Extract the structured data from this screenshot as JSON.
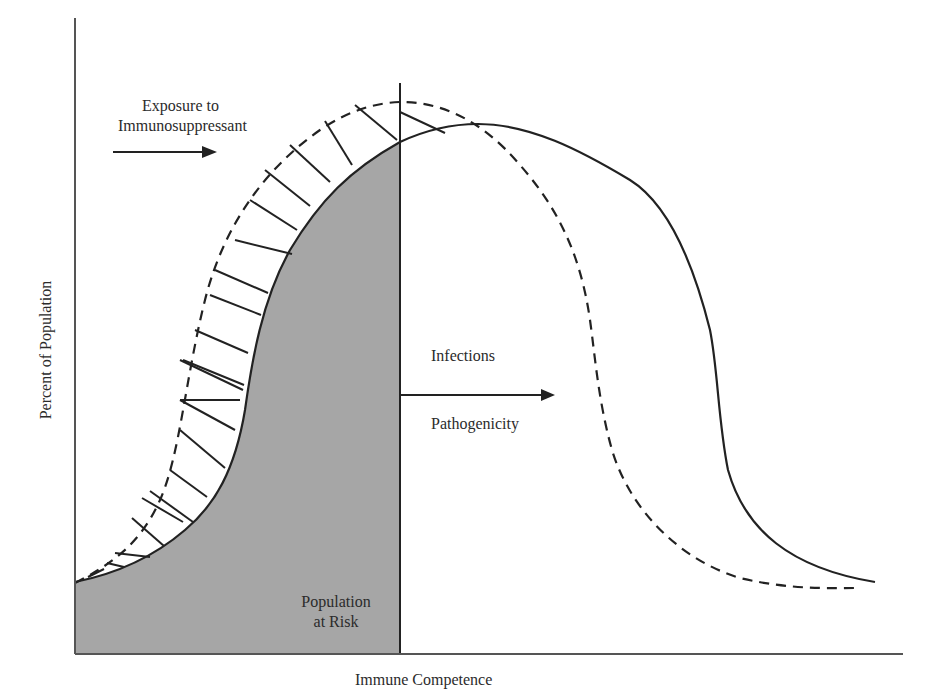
{
  "figure": {
    "x_axis_label": "Immune Competence",
    "y_axis_label": "Percent of Population",
    "annotations": {
      "exposure_line1": "Exposure to",
      "exposure_line2": "Immunosuppressant",
      "infections_line1": "Infections",
      "infections_line2": "Dose",
      "pathogenicity": "Pathogenicity",
      "risk_line1": "Population",
      "risk_line2": "at Risk"
    },
    "colors": {
      "line": "#222222",
      "shaded_area": "#a6a6a6",
      "axis": "#555555",
      "background": "#ffffff"
    },
    "curves": [
      {
        "name": "baseline-distribution",
        "style": "solid",
        "description": "Normal population immune competence distribution"
      },
      {
        "name": "shifted-distribution",
        "style": "dashed",
        "description": "Distribution after exposure to immunosuppressant"
      }
    ],
    "regions": [
      {
        "name": "population-at-risk",
        "style": "gray-fill",
        "bounded_by": "solid curve, left of threshold"
      },
      {
        "name": "added-risk",
        "style": "hatched",
        "bounded_by": "between dashed and solid curves, left of threshold"
      }
    ],
    "arrows": [
      {
        "name": "exposure-arrow",
        "direction": "right"
      },
      {
        "name": "infection-threshold-arrow",
        "direction": "right"
      }
    ]
  }
}
